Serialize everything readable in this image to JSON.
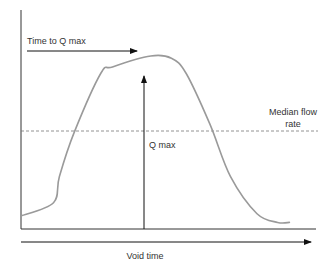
{
  "diagram": {
    "labels": {
      "time_to_qmax": "Time to Q max",
      "qmax": "Q max",
      "median_flow_line1": "Median flow",
      "median_flow_line2": "rate",
      "x_axis": "Void time"
    },
    "colors": {
      "curve": "#9a9a9a",
      "axes": "#333333",
      "arrows": "#111111",
      "dashed": "#777777",
      "text": "#333333"
    }
  },
  "chart_data": {
    "type": "line",
    "title": "",
    "xlabel": "Void time",
    "ylabel": "",
    "series": [
      {
        "name": "Flow rate",
        "x": [
          0,
          0.11,
          0.13,
          0.18,
          0.27,
          0.31,
          0.44,
          0.51,
          0.56,
          0.64,
          0.71,
          0.8,
          0.87,
          0.91
        ],
        "y": [
          0.06,
          0.12,
          0.24,
          0.44,
          0.71,
          0.74,
          0.79,
          0.78,
          0.71,
          0.48,
          0.24,
          0.07,
          0.03,
          0.03
        ]
      }
    ],
    "annotations": [
      "Time to Q max",
      "Q max",
      "Median flow rate"
    ],
    "median_flow_rate": 0.48,
    "qmax_time": 0.42,
    "xlim": [
      0,
      1
    ],
    "ylim": [
      0,
      1
    ],
    "grid": false
  }
}
